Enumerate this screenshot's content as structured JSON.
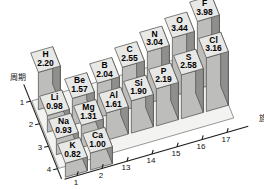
{
  "chart_data": {
    "type": "bar",
    "title": "",
    "xlabel": "族",
    "ylabel": "周期",
    "zlabel": "",
    "projection": "3d",
    "grid": false,
    "legend": null,
    "x_categories": [
      "1",
      "2",
      "13",
      "14",
      "15",
      "16",
      "17"
    ],
    "y_categories": [
      "1",
      "2",
      "3",
      "4"
    ],
    "zlim": [
      0,
      4.0
    ],
    "note": "Pauling electronegativity values shown as 3D bars; element symbol above value on each bar top",
    "bars": [
      {
        "element": "H",
        "value": "2.20",
        "value_num": 2.2,
        "group": "1",
        "period": "1"
      },
      {
        "element": "Li",
        "value": "0.98",
        "value_num": 0.98,
        "group": "1",
        "period": "2"
      },
      {
        "element": "Be",
        "value": "1.57",
        "value_num": 1.57,
        "group": "2",
        "period": "2"
      },
      {
        "element": "B",
        "value": "2.04",
        "value_num": 2.04,
        "group": "13",
        "period": "2"
      },
      {
        "element": "C",
        "value": "2.55",
        "value_num": 2.55,
        "group": "14",
        "period": "2"
      },
      {
        "element": "N",
        "value": "3.04",
        "value_num": 3.04,
        "group": "15",
        "period": "2"
      },
      {
        "element": "O",
        "value": "3.44",
        "value_num": 3.44,
        "group": "16",
        "period": "2"
      },
      {
        "element": "F",
        "value": "3.98",
        "value_num": 3.98,
        "group": "17",
        "period": "2"
      },
      {
        "element": "Na",
        "value": "0.93",
        "value_num": 0.93,
        "group": "1",
        "period": "3"
      },
      {
        "element": "Mg",
        "value": "1.31",
        "value_num": 1.31,
        "group": "2",
        "period": "3"
      },
      {
        "element": "Al",
        "value": "1.61",
        "value_num": 1.61,
        "group": "13",
        "period": "3"
      },
      {
        "element": "Si",
        "value": "1.90",
        "value_num": 1.9,
        "group": "14",
        "period": "3"
      },
      {
        "element": "P",
        "value": "2.19",
        "value_num": 2.19,
        "group": "15",
        "period": "3"
      },
      {
        "element": "S",
        "value": "2.58",
        "value_num": 2.58,
        "group": "16",
        "period": "3"
      },
      {
        "element": "Cl",
        "value": "3.16",
        "value_num": 3.16,
        "group": "17",
        "period": "3"
      },
      {
        "element": "K",
        "value": "0.82",
        "value_num": 0.82,
        "group": "1",
        "period": "4"
      },
      {
        "element": "Ca",
        "value": "1.00",
        "value_num": 1.0,
        "group": "2",
        "period": "4"
      }
    ],
    "colors": {
      "background": "#ffffff",
      "bar_top": "#e8e8e6",
      "bar_front": "#bdbdbb",
      "bar_side": "#8f8f8d",
      "bar_edge": "#4a4a48",
      "axis": "#1a1a1a",
      "text": "#000000"
    }
  },
  "axes": {
    "x": {
      "name": "族",
      "ticks": [
        "1",
        "2",
        "13",
        "14",
        "15",
        "16",
        "17"
      ]
    },
    "y": {
      "name": "周期",
      "ticks": [
        "1",
        "2",
        "3",
        "4"
      ]
    }
  }
}
